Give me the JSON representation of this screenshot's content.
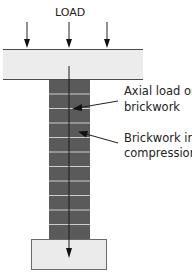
{
  "diagram": {
    "title": "LOAD",
    "labels": {
      "axial_line1": "Axial load on",
      "axial_line2": "brickwork",
      "compression_line1": "Brickwork in",
      "compression_line2": "compression"
    },
    "colors": {
      "slab_fill": "#ececec",
      "slab_edge": "#4a4a4a",
      "brick_fill": "#5a5a5a",
      "mortar": "#cdcdcd",
      "footing_fill": "#ebebeb",
      "footing_edge": "#6a6a6a",
      "arrow": "#111111",
      "text": "#222222"
    },
    "load_arrows_x": [
      27,
      69,
      107
    ],
    "mortar_lines_y": [
      94,
      108,
      123,
      137,
      152,
      166,
      181,
      196,
      210,
      225
    ]
  }
}
